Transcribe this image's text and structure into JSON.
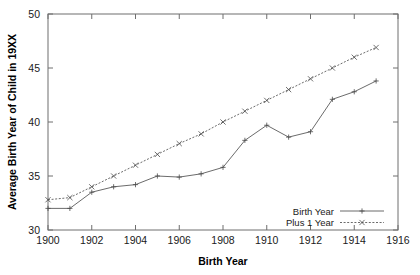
{
  "chart_data": {
    "type": "line",
    "title": "",
    "xlabel": "Birth Year",
    "ylabel": "Average Birth Year of Child in 19XX",
    "xlim": [
      1900,
      1916
    ],
    "ylim": [
      30,
      50
    ],
    "xticks": [
      1900,
      1902,
      1904,
      1906,
      1908,
      1910,
      1912,
      1914,
      1916
    ],
    "yticks": [
      30,
      35,
      40,
      45,
      50
    ],
    "xtick_labels": [
      "1900",
      "1902",
      "1904",
      "1906",
      "1908",
      "1910",
      "1912",
      "1914",
      "1916"
    ],
    "ytick_labels": [
      "30",
      "35",
      "40",
      "45",
      "50"
    ],
    "grid": false,
    "legend_position": "bottom-right",
    "x": [
      1900,
      1901,
      1902,
      1903,
      1904,
      1905,
      1906,
      1907,
      1908,
      1909,
      1910,
      1911,
      1912,
      1913,
      1914,
      1915
    ],
    "series": [
      {
        "name": "Birth Year",
        "marker": "plus",
        "linestyle": "solid",
        "color": "#5a5a5a",
        "values": [
          32.0,
          32.0,
          33.5,
          34.0,
          34.2,
          35.0,
          34.9,
          35.2,
          35.8,
          38.3,
          39.7,
          38.6,
          39.1,
          42.1,
          42.8,
          43.8
        ]
      },
      {
        "name": "Plus 1 Year",
        "marker": "cross",
        "linestyle": "dotted",
        "color": "#5a5a5a",
        "values": [
          32.8,
          33.0,
          34.0,
          35.0,
          36.0,
          37.0,
          38.0,
          38.9,
          40.0,
          41.0,
          42.0,
          43.0,
          44.0,
          45.0,
          46.0,
          46.9
        ]
      }
    ]
  },
  "legend": {
    "entries": [
      {
        "label": "Birth Year"
      },
      {
        "label": "Plus 1 Year"
      }
    ]
  },
  "axes": {
    "x_title": "Birth Year",
    "y_title": "Average Birth Year of Child in 19XX"
  }
}
